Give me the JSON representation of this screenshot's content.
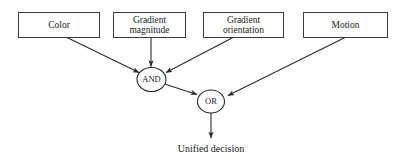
{
  "diagram": {
    "background_color": "#ffffff",
    "stroke_color": "#2b2b2b",
    "text_color": "#1a1a1a",
    "inputs": [
      {
        "id": "color",
        "label": "Color",
        "label_lines": [
          "Color"
        ]
      },
      {
        "id": "gradient-magnitude",
        "label": "Gradient magnitude",
        "label_lines": [
          "Gradient",
          "magnitude"
        ]
      },
      {
        "id": "gradient-orientation",
        "label": "Gradient orientation",
        "label_lines": [
          "Gradient",
          "orientation"
        ]
      },
      {
        "id": "motion",
        "label": "Motion",
        "label_lines": [
          "Motion"
        ]
      }
    ],
    "gates": [
      {
        "id": "and-gate",
        "label": "AND"
      },
      {
        "id": "or-gate",
        "label": "OR"
      }
    ],
    "output": {
      "id": "unified-decision",
      "label": "Unified decision"
    },
    "edges": [
      {
        "from": "color",
        "to": "and-gate"
      },
      {
        "from": "gradient-magnitude",
        "to": "and-gate"
      },
      {
        "from": "gradient-orientation",
        "to": "and-gate"
      },
      {
        "from": "and-gate",
        "to": "or-gate"
      },
      {
        "from": "motion",
        "to": "or-gate"
      },
      {
        "from": "or-gate",
        "to": "unified-decision"
      }
    ]
  }
}
